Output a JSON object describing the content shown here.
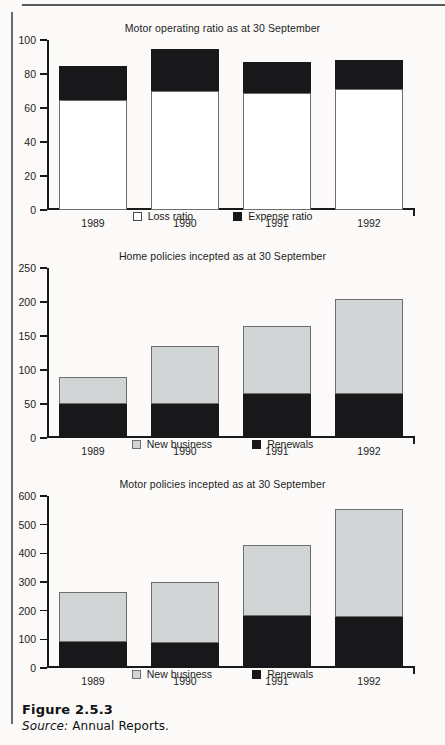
{
  "figure": {
    "number_label": "Figure 2.5.3",
    "source_word": "Source:",
    "source_text": "Annual Reports."
  },
  "chart_data": [
    {
      "type": "bar",
      "stacked": true,
      "title": "Motor operating ratio as at 30 September",
      "xlabel": "",
      "ylabel": "",
      "categories": [
        "1989",
        "1990",
        "1991",
        "1992"
      ],
      "ylim": [
        0,
        100
      ],
      "yticks": [
        0,
        20,
        40,
        60,
        80,
        100
      ],
      "ytick_labels": [
        "0",
        "20",
        "40",
        "60",
        "80",
        "100"
      ],
      "grid": false,
      "legend_position": "bottom",
      "series": [
        {
          "name": "Loss ratio",
          "color": "#ffffff",
          "values": [
            65,
            70,
            69,
            71
          ]
        },
        {
          "name": "Expense ratio",
          "color": "#18181a",
          "values": [
            20,
            25,
            18,
            17
          ]
        }
      ],
      "totals": [
        85,
        95,
        87,
        88
      ]
    },
    {
      "type": "bar",
      "stacked": true,
      "title": "Home policies incepted as at 30 September",
      "xlabel": "",
      "ylabel": "",
      "categories": [
        "1989",
        "1990",
        "1991",
        "1992"
      ],
      "ylim": [
        0,
        250
      ],
      "yticks": [
        0,
        50,
        100,
        150,
        200,
        250
      ],
      "ytick_labels": [
        "0",
        "50",
        "100",
        "150",
        "200",
        "250"
      ],
      "grid": false,
      "legend_position": "bottom",
      "series": [
        {
          "name": "Renewals",
          "color": "#18181a",
          "values": [
            50,
            50,
            65,
            65
          ]
        },
        {
          "name": "New business",
          "color": "#d2d5d5",
          "values": [
            40,
            85,
            100,
            140
          ]
        }
      ],
      "totals": [
        90,
        135,
        165,
        205
      ]
    },
    {
      "type": "bar",
      "stacked": true,
      "title": "Motor policies incepted as at 30 September",
      "xlabel": "",
      "ylabel": "",
      "categories": [
        "1989",
        "1990",
        "1991",
        "1992"
      ],
      "ylim": [
        0,
        600
      ],
      "yticks": [
        0,
        100,
        200,
        300,
        400,
        500,
        600
      ],
      "ytick_labels": [
        "0",
        "100",
        "200",
        "300",
        "400",
        "500",
        "600"
      ],
      "grid": false,
      "legend_position": "bottom",
      "series": [
        {
          "name": "Renewals",
          "color": "#18181a",
          "values": [
            90,
            88,
            180,
            178
          ]
        },
        {
          "name": "New business",
          "color": "#d2d5d5",
          "values": [
            175,
            212,
            248,
            377
          ]
        }
      ],
      "totals": [
        265,
        300,
        428,
        555
      ]
    }
  ],
  "charts": [
    {
      "id": "motor-operating-ratio",
      "title": "Motor operating ratio as at 30 September",
      "ytick_labels": [
        "100",
        "80",
        "60",
        "40",
        "20",
        "0"
      ],
      "xtick_labels": [
        "1989",
        "1990",
        "1991",
        "1992"
      ],
      "legend": [
        {
          "label": "Loss ratio",
          "swatch": "white"
        },
        {
          "label": "Expense ratio",
          "swatch": "black"
        }
      ]
    },
    {
      "id": "home-policies-incepted",
      "title": "Home policies incepted as at 30 September",
      "ytick_labels": [
        "250",
        "200",
        "150",
        "100",
        "50",
        "0"
      ],
      "xtick_labels": [
        "1989",
        "1990",
        "1991",
        "1992"
      ],
      "legend": [
        {
          "label": "New business",
          "swatch": "gray"
        },
        {
          "label": "Renewals",
          "swatch": "black"
        }
      ]
    },
    {
      "id": "motor-policies-incepted",
      "title": "Motor policies incepted as at 30 September",
      "ytick_labels": [
        "600",
        "500",
        "400",
        "300",
        "200",
        "100",
        "0"
      ],
      "xtick_labels": [
        "1989",
        "1990",
        "1991",
        "1992"
      ],
      "legend": [
        {
          "label": "New business",
          "swatch": "gray"
        },
        {
          "label": "Renewals",
          "swatch": "black"
        }
      ]
    }
  ]
}
